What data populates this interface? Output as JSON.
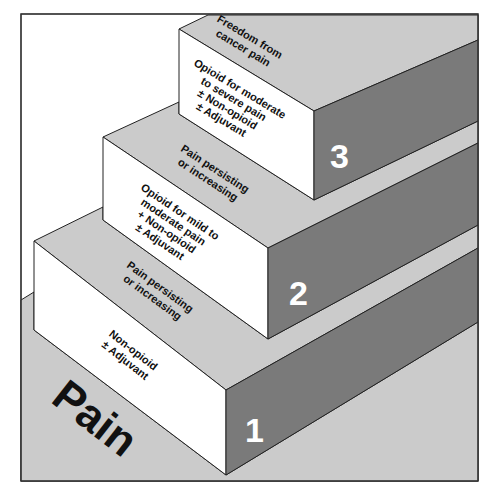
{
  "diagram": {
    "type": "staircase",
    "colors": {
      "frame": "#333333",
      "background": "#ffffff",
      "top_surface": "#cbcbcb",
      "floor": "#cbcbcb",
      "front_face": "#ffffff",
      "side_face": "#7a7a7a",
      "number_text": "#ffffff",
      "label_text": "#111111"
    },
    "base_label": "Pain",
    "steps": [
      {
        "number": "1",
        "front_lines": [
          "Non-opioid",
          "± Adjuvant"
        ],
        "top_lines": [
          "Pain persisting",
          "or increasing"
        ]
      },
      {
        "number": "2",
        "front_lines": [
          "Opioid for mild to",
          "moderate pain",
          "+ Non-opioid",
          "± Adjuvant"
        ],
        "top_lines": [
          "Pain persisting",
          "or increasing"
        ]
      },
      {
        "number": "3",
        "front_lines": [
          "Opioid for moderate",
          "to severe pain",
          "± Non-opioid",
          "± Adjuvant"
        ],
        "top_lines": [
          "Freedom from",
          "cancer pain"
        ]
      }
    ]
  }
}
